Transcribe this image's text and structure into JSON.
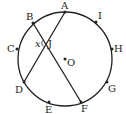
{
  "diagram": {
    "type": "circle-chords",
    "circle": {
      "center": [
        65,
        59
      ],
      "radius": 47,
      "stroke": "#222222"
    },
    "center_label": "O",
    "points": [
      {
        "name": "A",
        "x": 65,
        "y": 12,
        "label_x": 60,
        "label_y": 10
      },
      {
        "name": "I",
        "x": 96,
        "y": 22,
        "label_x": 99,
        "label_y": 19
      },
      {
        "name": "H",
        "x": 112,
        "y": 49,
        "label_x": 114,
        "label_y": 52
      },
      {
        "name": "G",
        "x": 107,
        "y": 82,
        "label_x": 109,
        "label_y": 91
      },
      {
        "name": "F",
        "x": 81,
        "y": 102,
        "label_x": 82,
        "label_y": 112
      },
      {
        "name": "E",
        "x": 49,
        "y": 102,
        "label_x": 45,
        "label_y": 112
      },
      {
        "name": "D",
        "x": 24,
        "y": 82,
        "label_x": 16,
        "label_y": 92
      },
      {
        "name": "C",
        "x": 17,
        "y": 49,
        "label_x": 7,
        "label_y": 52
      },
      {
        "name": "B",
        "x": 33,
        "y": 23,
        "label_x": 26,
        "label_y": 19
      }
    ],
    "chords": [
      {
        "from": "A",
        "to": "D"
      },
      {
        "from": "B",
        "to": "F"
      }
    ],
    "intersection": {
      "label": "J",
      "x": 46,
      "y": 43
    },
    "angle_label": "x"
  }
}
